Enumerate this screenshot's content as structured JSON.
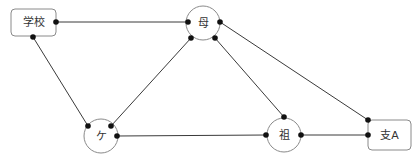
{
  "diagram": {
    "type": "network-graph",
    "nodes": [
      {
        "id": "school",
        "label": "学校",
        "shape": "rounded-rect",
        "x": 11,
        "y": 9,
        "w": 45,
        "h": 27
      },
      {
        "id": "mother",
        "label": "母",
        "shape": "circle",
        "cx": 203,
        "cy": 23,
        "r": 17
      },
      {
        "id": "ke",
        "label": "ケ",
        "shape": "circle",
        "cx": 101,
        "cy": 136,
        "r": 17
      },
      {
        "id": "grandparent",
        "label": "祖",
        "shape": "circle",
        "cx": 284,
        "cy": 135,
        "r": 17
      },
      {
        "id": "branch_a",
        "label": "支A",
        "shape": "rounded-rect",
        "x": 368,
        "y": 120,
        "w": 43,
        "h": 30
      }
    ],
    "edges": [
      {
        "from": "school",
        "to": "mother",
        "x1": 56,
        "y1": 22,
        "x2": 188,
        "y2": 22
      },
      {
        "from": "school",
        "to": "ke",
        "x1": 33,
        "y1": 37,
        "x2": 88,
        "y2": 126
      },
      {
        "from": "mother",
        "to": "ke",
        "x1": 191,
        "y1": 38,
        "x2": 111,
        "y2": 126
      },
      {
        "from": "mother",
        "to": "grandparent",
        "x1": 215,
        "y1": 38,
        "x2": 284,
        "y2": 117
      },
      {
        "from": "mother",
        "to": "branch_a",
        "x1": 220,
        "y1": 22,
        "x2": 368,
        "y2": 120
      },
      {
        "from": "ke",
        "to": "grandparent",
        "x1": 117,
        "y1": 136,
        "x2": 266,
        "y2": 135
      },
      {
        "from": "grandparent",
        "to": "branch_a",
        "x1": 301,
        "y1": 135,
        "x2": 368,
        "y2": 135
      }
    ]
  },
  "colors": {
    "edge": "#3a3a3a",
    "dot": "#111111",
    "node_border": "#8a8a8a",
    "label": "#333333",
    "background": "#ffffff"
  }
}
